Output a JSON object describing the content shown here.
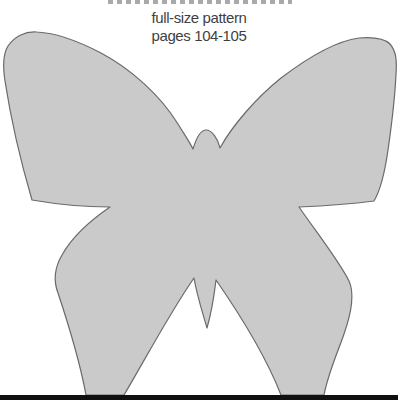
{
  "header": {
    "subtitle_line1": "full-size pattern",
    "subtitle_line2": "pages 104-105"
  },
  "butterfly_pattern": {
    "path": "M206,130 C212,130 218,139 220,148 C232,126 256,98 281,78 C306,59 336,41 359,38 C372,37 384,38 390,44 C396,51 397,60 396,74 C395,97 392,122 388,150 C385,171 380,191 374,201 C351,204 322,206 299,207 C317,233 339,261 349,281 C355,294 351,314 344,334 C337,354 328,374 324,395 L281,395 C267,359 243,319 216,280 C214,297 211,314 207,328 C203,314 197,296 194,278 C171,311 147,356 124,395 L86,395 C81,368 71,332 58,293 C53,280 55,267 62,255 C72,237 91,220 110,207 C84,207 55,204 32,200 C22,166 11,120 5,81 C3,68 3,54 8,46 C14,37 25,31 37,32 C56,33 80,42 101,53 C131,69 160,95 178,124 C184,134 189,141 193,149 C196,139 200,130 206,130 Z"
  },
  "theme": {
    "text_color": "#3f3f3f",
    "title_fragment_color": "#9a9a9a",
    "pattern_fill": "#cacaca",
    "pattern_outline": "#6a6a6a",
    "footer_bar_color": "#101010"
  }
}
